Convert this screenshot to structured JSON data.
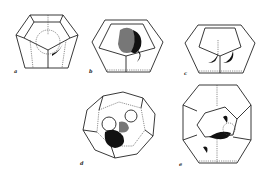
{
  "figure": {
    "panels": [
      {
        "id": "a",
        "label": "a",
        "shape": "dodecahedron"
      },
      {
        "id": "b",
        "label": "b",
        "shape": "dodecahedron"
      },
      {
        "id": "c",
        "label": "c",
        "shape": "dodecahedron"
      },
      {
        "id": "d",
        "label": "d",
        "shape": "hexakaidecahedron"
      },
      {
        "id": "e",
        "label": "e",
        "shape": "tetrakaidecahedron"
      }
    ]
  }
}
